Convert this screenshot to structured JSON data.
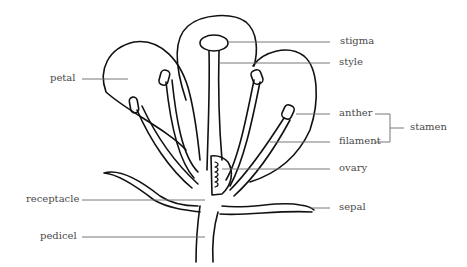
{
  "diagram": {
    "labels": {
      "stigma": "stigma",
      "style": "style",
      "petal": "petal",
      "anther": "anther",
      "filament": "filament",
      "stamen": "stamen",
      "ovary": "ovary",
      "receptacle": "receptacle",
      "sepal": "sepal",
      "pedicel": "pedicel"
    },
    "groupings": [
      {
        "group": "stamen",
        "members": [
          "anther",
          "filament"
        ]
      }
    ],
    "colors": {
      "outline": "#111111",
      "label_text": "#4a4a4a",
      "leader_line": "#6a6a6a",
      "background": "#ffffff"
    }
  }
}
